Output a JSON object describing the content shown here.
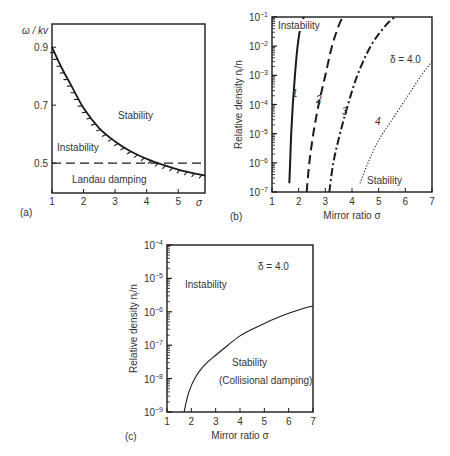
{
  "chart_data": [
    {
      "panel": "(a)",
      "type": "line",
      "xlabel": "σ",
      "ylabel": "ω / kv",
      "xlim": [
        1,
        5.85
      ],
      "ylim": [
        0.397,
        0.98
      ],
      "xticks": [
        "1",
        "2",
        "3",
        "4",
        "5"
      ],
      "yticks": [
        "0.9",
        "0.7",
        "0.5"
      ],
      "series": [
        {
          "name": "stability boundary (hatched)",
          "style": "solid-hatched",
          "x": [
            1.0,
            1.3,
            1.6,
            2.0,
            2.5,
            3.0,
            3.5,
            4.0,
            4.5,
            5.0,
            5.5,
            5.85
          ],
          "y": [
            0.9,
            0.83,
            0.77,
            0.69,
            0.62,
            0.575,
            0.54,
            0.515,
            0.495,
            0.478,
            0.465,
            0.457
          ]
        },
        {
          "name": "Landau damping limit",
          "style": "dashed",
          "x": [
            1,
            5.85
          ],
          "y": [
            0.5,
            0.5
          ]
        }
      ],
      "annotations": [
        "Stability",
        "Instability",
        "Landau damping"
      ]
    },
    {
      "panel": "(b)",
      "type": "line",
      "xlabel": "Mirror ratio σ",
      "ylabel": "Relative density n_i/n",
      "yscale": "log",
      "xlim": [
        1,
        7
      ],
      "ylim": [
        1e-07,
        0.1
      ],
      "xticks": [
        "1",
        "2",
        "3",
        "4",
        "5",
        "6",
        "7"
      ],
      "yticks": [
        "10^-1",
        "10^-2",
        "10^-3",
        "10^-4",
        "10^-5",
        "10^-6",
        "10^-7"
      ],
      "series": [
        {
          "name": "1",
          "style": "solid",
          "x": [
            1.65,
            1.68,
            1.72,
            1.78,
            1.86,
            1.96,
            2.08,
            2.2
          ],
          "y": [
            2e-07,
            1e-06,
            1e-05,
            0.0001,
            0.001,
            0.01,
            0.05,
            0.1
          ]
        },
        {
          "name": "2",
          "style": "dashed",
          "x": [
            2.3,
            2.4,
            2.55,
            2.75,
            3.0,
            3.25,
            3.5,
            3.65
          ],
          "y": [
            1e-07,
            1e-06,
            1e-05,
            0.0001,
            0.001,
            0.01,
            0.05,
            0.1
          ]
        },
        {
          "name": "3",
          "style": "dash-dot",
          "x": [
            3.15,
            3.3,
            3.55,
            3.85,
            4.2,
            4.7,
            5.25,
            5.6
          ],
          "y": [
            1e-07,
            1e-06,
            1e-05,
            0.0001,
            0.001,
            0.01,
            0.05,
            0.1
          ]
        },
        {
          "name": "4",
          "style": "dotted",
          "x": [
            4.3,
            4.6,
            5.0,
            5.5,
            6.1,
            6.6,
            7.0
          ],
          "y": [
            2e-07,
            1e-06,
            6e-06,
            3e-05,
            0.0002,
            0.001,
            0.003
          ]
        }
      ],
      "annotations": [
        "Instability",
        "Stability",
        "δ = 4.0",
        "1",
        "2",
        "3",
        "4"
      ]
    },
    {
      "panel": "(c)",
      "type": "line",
      "xlabel": "Mirror ratio σ",
      "ylabel": "Relative density n_i/n",
      "yscale": "log",
      "xlim": [
        1,
        7
      ],
      "ylim": [
        1e-09,
        0.0001
      ],
      "xticks": [
        "1",
        "2",
        "3",
        "4",
        "5",
        "6",
        "7"
      ],
      "yticks": [
        "10^-4",
        "10^-5",
        "10^-6",
        "10^-7",
        "10^-8",
        "10^-9"
      ],
      "series": [
        {
          "name": "collisional damping boundary",
          "style": "solid",
          "x": [
            1.7,
            1.9,
            2.2,
            2.6,
            3.0,
            3.5,
            4.0,
            4.5,
            5.0,
            5.5,
            6.0,
            6.5,
            7.0
          ],
          "y": [
            1e-09,
            4e-09,
            1.2e-08,
            2.8e-08,
            5e-08,
            1e-07,
            1.9e-07,
            3e-07,
            4.5e-07,
            6.5e-07,
            9e-07,
            1.2e-06,
            1.5e-06
          ]
        }
      ],
      "annotations": [
        "Instability",
        "Stability",
        "(Collisional damping)",
        "δ = 4.0"
      ]
    }
  ],
  "labels": {
    "a": {
      "panel": "(a)",
      "ylabel": "ω / kv",
      "xlabel": "σ",
      "stability": "Stability",
      "instability": "Instability",
      "landau": "Landau damping",
      "xticks": [
        "1",
        "2",
        "3",
        "4",
        "5"
      ],
      "yticks": [
        "0.9",
        "0.7",
        "0.5"
      ]
    },
    "b": {
      "panel": "(b)",
      "ylabel": "Relative density n",
      "ylabel_sub": "i",
      "ylabel_tail": "/n",
      "xlabel": "Mirror ratio σ",
      "instability": "Instability",
      "stability": "Stability",
      "delta": "δ  = 4.0",
      "curve1": "1",
      "curve2": "2",
      "curve3": "3",
      "curve4": "4",
      "xticks": [
        "1",
        "2",
        "3",
        "4",
        "5",
        "6",
        "7"
      ],
      "yexp": [
        "−1",
        "−2",
        "−3",
        "−4",
        "−5",
        "−6",
        "−7"
      ],
      "ybase": "10"
    },
    "c": {
      "panel": "(c)",
      "ylabel": "Relative density n",
      "ylabel_sub": "i",
      "ylabel_tail": "/n",
      "xlabel": "Mirror ratio σ",
      "instability": "Instability",
      "stability": "Stability",
      "collisional": "(Collisional damping)",
      "delta": "δ  = 4.0",
      "xticks": [
        "1",
        "2",
        "3",
        "4",
        "5",
        "6",
        "7"
      ],
      "yexp": [
        "−4",
        "−5",
        "−6",
        "−7",
        "−8",
        "−9"
      ],
      "ybase": "10"
    }
  },
  "colors": {
    "line": "#1a1a1a",
    "text": "#333333",
    "background": "#ffffff"
  }
}
